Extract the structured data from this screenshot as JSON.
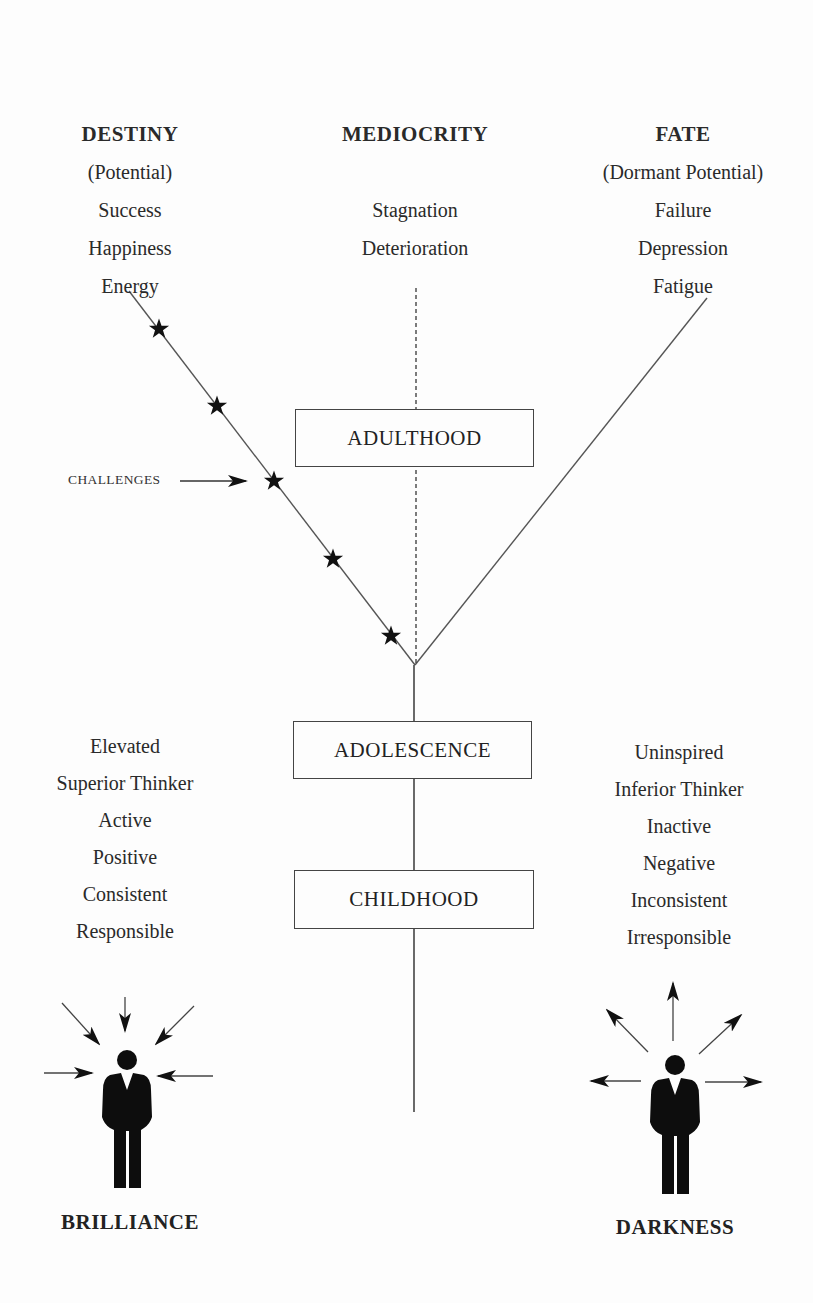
{
  "outcomes": {
    "destiny": {
      "title": "DESTINY",
      "items": [
        "(Potential)",
        "Success",
        "Happiness",
        "Energy"
      ]
    },
    "mediocrity": {
      "title": "MEDIOCRITY",
      "items": [
        "Stagnation",
        "Deterioration"
      ]
    },
    "fate": {
      "title": "FATE",
      "items": [
        "(Dormant Potential)",
        "Failure",
        "Depression",
        "Fatigue"
      ]
    }
  },
  "stages": {
    "adulthood": "ADULTHOOD",
    "adolescence": "ADOLESCENCE",
    "childhood": "CHILDHOOD"
  },
  "challenges_label": "CHALLENGES",
  "challenge_star_count": 5,
  "traits": {
    "positive": [
      "Elevated",
      "Superior Thinker",
      "Active",
      "Positive",
      "Consistent",
      "Responsible"
    ],
    "negative": [
      "Uninspired",
      "Inferior Thinker",
      "Inactive",
      "Negative",
      "Inconsistent",
      "Irresponsible"
    ]
  },
  "figures": {
    "left": {
      "label": "BRILLIANCE",
      "arrow_direction": "inward"
    },
    "right": {
      "label": "DARKNESS",
      "arrow_direction": "outward"
    }
  }
}
